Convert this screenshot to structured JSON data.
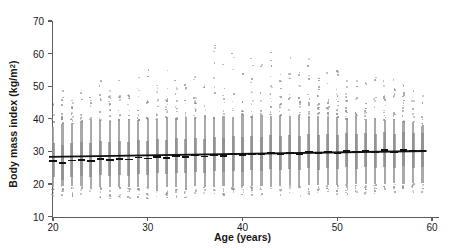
{
  "chart_data": {
    "type": "scatter",
    "title": "",
    "xlabel": "Age (years)",
    "ylabel_text": "Body mass index (kg/m",
    "ylabel_sup": "2",
    "ylabel_close": ")",
    "ylabel_full": "Body mass index (kg/m2)",
    "xlim": [
      19,
      60
    ],
    "ylim": [
      10,
      72
    ],
    "xticks": [
      20,
      30,
      40,
      50,
      60
    ],
    "yticks": [
      10,
      20,
      30,
      40,
      50,
      60,
      70
    ],
    "grid": false,
    "legend": "none",
    "marker_color": "#8f8f8f",
    "line_color": "#111111",
    "axis_color": "#5d5d5d",
    "series": [
      {
        "name": "Individual observations",
        "type": "strip",
        "note": "One dense vertical column of points per integer age from 20 to 59",
        "ages": [
          20,
          21,
          22,
          23,
          24,
          25,
          26,
          27,
          28,
          29,
          30,
          31,
          32,
          33,
          34,
          35,
          36,
          37,
          38,
          39,
          40,
          41,
          42,
          43,
          44,
          45,
          46,
          47,
          48,
          49,
          50,
          51,
          52,
          53,
          54,
          55,
          56,
          57,
          58,
          59
        ],
        "dense_low": [
          19.5,
          19.4,
          19.3,
          19.3,
          19.2,
          19.2,
          19.1,
          19.1,
          19.0,
          19.0,
          19.2,
          19.1,
          19.1,
          19.0,
          19.2,
          19.3,
          19.2,
          19.1,
          19.3,
          19.2,
          19.4,
          19.3,
          19.4,
          19.5,
          19.4,
          19.6,
          19.5,
          19.7,
          19.6,
          19.8,
          19.7,
          19.9,
          20.0,
          19.9,
          20.1,
          20.0,
          20.2,
          20.1,
          20.3,
          20.2
        ],
        "dense_high": [
          37.5,
          38.4,
          38.8,
          39.2,
          39.0,
          39.6,
          39.4,
          39.8,
          40.0,
          39.7,
          40.2,
          40.0,
          40.4,
          40.1,
          40.6,
          40.3,
          40.8,
          40.5,
          40.9,
          40.6,
          41.0,
          40.7,
          41.1,
          40.8,
          41.2,
          40.9,
          41.0,
          40.6,
          40.8,
          40.4,
          40.6,
          40.2,
          40.4,
          40.0,
          40.1,
          39.7,
          39.8,
          39.2,
          39.0,
          37.8
        ],
        "whisker_low": [
          16.6,
          16.0,
          15.9,
          16.2,
          16.0,
          15.8,
          15.7,
          16.0,
          15.8,
          16.1,
          15.6,
          16.0,
          15.9,
          16.2,
          16.0,
          15.8,
          16.1,
          16.3,
          16.0,
          16.2,
          16.1,
          16.4,
          16.2,
          16.5,
          16.3,
          16.6,
          16.4,
          16.7,
          16.5,
          16.8,
          16.6,
          17.0,
          16.8,
          17.1,
          16.9,
          17.2,
          17.0,
          17.3,
          17.1,
          17.4
        ],
        "whisker_high": [
          45.0,
          49.5,
          46.0,
          51.0,
          48.5,
          52.0,
          50.5,
          53.0,
          51.5,
          54.0,
          55.5,
          52.5,
          57.0,
          53.5,
          56.0,
          58.5,
          55.0,
          64.5,
          57.5,
          61.0,
          56.5,
          60.0,
          58.0,
          62.5,
          57.0,
          59.5,
          56.0,
          61.5,
          58.5,
          55.5,
          60.5,
          54.5,
          57.5,
          53.0,
          58.0,
          52.5,
          55.0,
          51.0,
          54.0,
          49.0
        ]
      },
      {
        "name": "Per-age median",
        "type": "marker-bar",
        "ages": [
          20,
          21,
          22,
          23,
          24,
          25,
          26,
          27,
          28,
          29,
          30,
          31,
          32,
          33,
          34,
          35,
          36,
          37,
          38,
          39,
          40,
          41,
          42,
          43,
          44,
          45,
          46,
          47,
          48,
          49,
          50,
          51,
          52,
          53,
          54,
          55,
          56,
          57,
          58,
          59
        ],
        "values": [
          27.0,
          26.3,
          27.2,
          27.4,
          27.1,
          27.6,
          27.3,
          27.7,
          27.5,
          28.1,
          27.8,
          28.3,
          28.0,
          28.5,
          28.2,
          28.7,
          28.4,
          28.9,
          28.6,
          29.1,
          28.8,
          29.3,
          29.0,
          29.5,
          29.2,
          29.6,
          29.3,
          29.8,
          29.4,
          29.9,
          29.5,
          30.1,
          29.7,
          30.2,
          29.8,
          30.3,
          29.9,
          30.4,
          30.0,
          30.2
        ]
      },
      {
        "name": "Linear trend",
        "type": "line",
        "x": [
          20,
          59
        ],
        "y": [
          28.3,
          30.1
        ]
      }
    ]
  }
}
